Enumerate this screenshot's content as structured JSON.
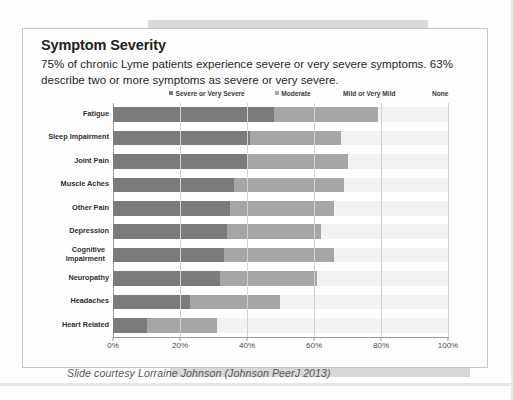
{
  "slide": {
    "title": "Symptom Severity",
    "subtitle": "75% of chronic Lyme patients experience severe  or very severe symptoms. 63% describe two or more symptoms as severe or very severe.",
    "footer": "Slide courtesy Lorraine Johnson (Johnson PeerJ 2013)"
  },
  "legend": {
    "items": [
      {
        "label": "Severe or Very Severe",
        "color": "#7b7b7b",
        "swatch": true
      },
      {
        "label": "Moderate",
        "color": "#a6a6a6",
        "swatch": true
      },
      {
        "label": "Mild or Very Mild",
        "color": "#f2f2f2",
        "swatch": false
      },
      {
        "label": "None",
        "color": "#ffffff",
        "swatch": false
      }
    ]
  },
  "chart_data": {
    "type": "bar",
    "orientation": "horizontal",
    "stacked": true,
    "stack_mode": "percent",
    "title": "Symptom Severity",
    "xlabel": "",
    "ylabel": "",
    "xlim": [
      0,
      100
    ],
    "xticks": [
      "0%",
      "20%",
      "40%",
      "60%",
      "80%",
      "100%"
    ],
    "xtick_values": [
      0,
      20,
      40,
      60,
      80,
      100
    ],
    "grid": true,
    "legend_position": "top",
    "categories": [
      "Fatigue",
      "Sleep Impairment",
      "Joint Pain",
      "Muscle Aches",
      "Other Pain",
      "Depression",
      "Cognitive Impairment",
      "Neuropathy",
      "Headaches",
      "Heart Related"
    ],
    "series": [
      {
        "name": "Severe or Very Severe",
        "color": "#7b7b7b",
        "values": [
          48,
          41,
          40,
          36,
          35,
          34,
          33,
          32,
          23,
          10
        ]
      },
      {
        "name": "Moderate",
        "color": "#a6a6a6",
        "values": [
          31,
          27,
          30,
          33,
          31,
          28,
          33,
          29,
          27,
          21
        ]
      },
      {
        "name": "Mild or Very Mild",
        "color": "#f2f2f2",
        "values": [
          21,
          32,
          30,
          31,
          34,
          38,
          34,
          39,
          50,
          69
        ]
      },
      {
        "name": "None",
        "color": "#ffffff",
        "values": [
          0,
          0,
          0,
          0,
          0,
          0,
          0,
          0,
          0,
          0
        ]
      }
    ]
  }
}
